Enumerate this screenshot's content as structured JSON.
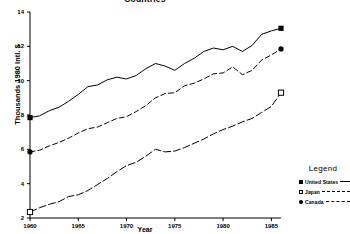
{
  "chart_data": {
    "type": "line",
    "title": "Countries",
    "xlabel": "Year",
    "ylabel": "Thousands 1980 Intl. $",
    "xlim": [
      1960,
      1986
    ],
    "ylim": [
      2,
      14
    ],
    "xticks": [
      "1960",
      "1965",
      "1970",
      "1975",
      "1980",
      "1985"
    ],
    "xtick_values": [
      1960,
      1965,
      1970,
      1975,
      1980,
      1985
    ],
    "yticks": [
      "2",
      "4",
      "6",
      "8",
      "10",
      "12",
      "14"
    ],
    "ytick_values": [
      2,
      4,
      6,
      8,
      10,
      12,
      14
    ],
    "grid": false,
    "legend_position": "right",
    "x": [
      1960,
      1961,
      1962,
      1963,
      1964,
      1965,
      1966,
      1967,
      1968,
      1969,
      1970,
      1971,
      1972,
      1973,
      1974,
      1975,
      1976,
      1977,
      1978,
      1979,
      1980,
      1981,
      1982,
      1983,
      1984,
      1985,
      1986
    ],
    "series": [
      {
        "name": "United States",
        "marker": "filled-square",
        "linestyle": "solid",
        "values": [
          7.85,
          7.95,
          8.25,
          8.45,
          8.8,
          9.2,
          9.65,
          9.75,
          10.05,
          10.2,
          10.1,
          10.3,
          10.7,
          11.0,
          10.85,
          10.6,
          11.0,
          11.3,
          11.7,
          11.9,
          11.8,
          12.0,
          11.7,
          12.05,
          12.7,
          12.9,
          13.05
        ]
      },
      {
        "name": "Japan",
        "marker": "open-square",
        "linestyle": "dash-dot",
        "values": [
          2.35,
          2.6,
          2.8,
          2.95,
          3.25,
          3.35,
          3.6,
          3.95,
          4.3,
          4.7,
          5.05,
          5.25,
          5.6,
          6.0,
          5.85,
          5.9,
          6.1,
          6.35,
          6.6,
          6.9,
          7.15,
          7.35,
          7.6,
          7.8,
          8.15,
          8.5,
          9.3
        ]
      },
      {
        "name": "Canada",
        "marker": "filled-circle",
        "linestyle": "dashed",
        "values": [
          5.85,
          5.95,
          6.2,
          6.4,
          6.65,
          6.95,
          7.2,
          7.3,
          7.55,
          7.8,
          7.9,
          8.2,
          8.55,
          9.0,
          9.25,
          9.3,
          9.7,
          9.85,
          10.1,
          10.4,
          10.45,
          10.8,
          10.35,
          10.6,
          11.2,
          11.5,
          11.85
        ]
      }
    ]
  },
  "legend": {
    "title": "Legend",
    "entries": [
      {
        "label": "United States"
      },
      {
        "label": "Japan"
      },
      {
        "label": "Canada"
      }
    ]
  }
}
